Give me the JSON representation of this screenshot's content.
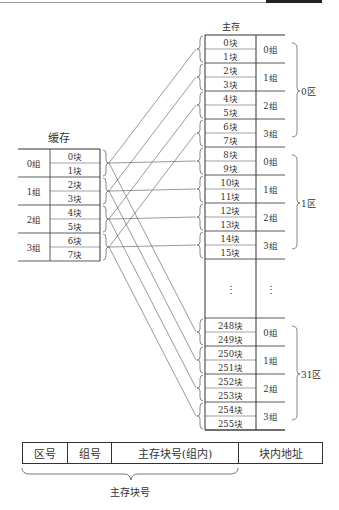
{
  "cache": {
    "title": "缓存",
    "groups": [
      {
        "label": "0组",
        "blocks": [
          "0块",
          "1块"
        ]
      },
      {
        "label": "1组",
        "blocks": [
          "2块",
          "3块"
        ]
      },
      {
        "label": "2组",
        "blocks": [
          "4块",
          "5块"
        ]
      },
      {
        "label": "3组",
        "blocks": [
          "6块",
          "7块"
        ]
      }
    ]
  },
  "main_memory": {
    "title": "主存",
    "regions": [
      {
        "label": "0区",
        "groups": [
          {
            "label": "0组",
            "blocks": [
              "0块",
              "1块"
            ]
          },
          {
            "label": "1组",
            "blocks": [
              "2块",
              "3块"
            ]
          },
          {
            "label": "2组",
            "blocks": [
              "4块",
              "5块"
            ]
          },
          {
            "label": "3组",
            "blocks": [
              "6块",
              "7块"
            ]
          }
        ]
      },
      {
        "label": "1区",
        "groups": [
          {
            "label": "0组",
            "blocks": [
              "8块",
              "9块"
            ]
          },
          {
            "label": "1组",
            "blocks": [
              "10块",
              "11块"
            ]
          },
          {
            "label": "2组",
            "blocks": [
              "12块",
              "13块"
            ]
          },
          {
            "label": "3组",
            "blocks": [
              "14块",
              "15块"
            ]
          }
        ]
      },
      {
        "label": "31区",
        "groups": [
          {
            "label": "0组",
            "blocks": [
              "248块",
              "249块"
            ]
          },
          {
            "label": "1组",
            "blocks": [
              "250块",
              "251块"
            ]
          },
          {
            "label": "2组",
            "blocks": [
              "252块",
              "253块"
            ]
          },
          {
            "label": "3组",
            "blocks": [
              "254块",
              "255块"
            ]
          }
        ]
      }
    ],
    "ellipsis": "⋮"
  },
  "address_format": {
    "fields": [
      "区号",
      "组号",
      "主存块号(组内)",
      "块内地址"
    ],
    "caption": "主存块号"
  }
}
